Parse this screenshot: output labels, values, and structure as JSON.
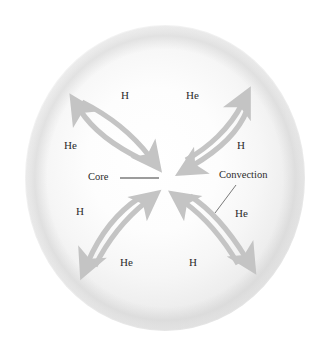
{
  "figure": {
    "name": "stellar-convection-diagram",
    "background_color": "#ffffff",
    "sphere": {
      "name": "star-sphere",
      "center_x": 165,
      "center_y": 178,
      "radius_x": 140,
      "radius_y": 153,
      "fill_center_color": "#ffffff",
      "fill_edge_color": "#d9d9d9"
    },
    "arrow_color": "#c4c4c4",
    "text_color": "#2b2b2b",
    "leader_line_color": "#3a3a3a"
  },
  "callouts": [
    {
      "id": "core",
      "label": "Core",
      "x": 88,
      "y": 172,
      "leader": {
        "x1": 120,
        "y1": 178,
        "x2": 159,
        "y2": 178
      }
    },
    {
      "id": "convection",
      "label": "Convection",
      "x": 219,
      "y": 170,
      "leader": {
        "x1": 236,
        "y1": 185,
        "x2": 215,
        "y2": 213
      }
    }
  ],
  "loops": [
    {
      "id": "upper-left",
      "quadrant": "upper-left",
      "outer_label": {
        "text": "He",
        "x": 64,
        "y": 140
      },
      "inner_label": {
        "text": "H",
        "x": 121,
        "y": 90
      }
    },
    {
      "id": "upper-right",
      "quadrant": "upper-right",
      "outer_label": {
        "text": "H",
        "x": 237,
        "y": 140
      },
      "inner_label": {
        "text": "He",
        "x": 186,
        "y": 90
      }
    },
    {
      "id": "lower-left",
      "quadrant": "lower-left",
      "outer_label": {
        "text": "H",
        "x": 76,
        "y": 206
      },
      "inner_label": {
        "text": "He",
        "x": 120,
        "y": 257
      }
    },
    {
      "id": "lower-right",
      "quadrant": "lower-right",
      "outer_label": {
        "text": "He",
        "x": 235,
        "y": 208
      },
      "inner_label": {
        "text": "H",
        "x": 189,
        "y": 257
      }
    }
  ]
}
